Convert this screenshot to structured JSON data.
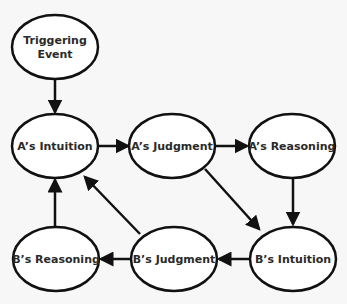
{
  "diagram": {
    "title": "",
    "nodes": [
      {
        "id": "trigger",
        "label_lines": [
          "Triggering",
          "Event"
        ],
        "cx": 55,
        "cy": 47,
        "rx": 43,
        "ry": 32
      },
      {
        "id": "a_intuition",
        "label_lines": [
          "A’s Intuition"
        ],
        "cx": 55,
        "cy": 146,
        "rx": 43,
        "ry": 32
      },
      {
        "id": "a_judgment",
        "label_lines": [
          "A’s Judgment"
        ],
        "cx": 172,
        "cy": 146,
        "rx": 43,
        "ry": 32
      },
      {
        "id": "a_reasoning",
        "label_lines": [
          "A’s Reasoning"
        ],
        "cx": 292,
        "cy": 146,
        "rx": 43,
        "ry": 32
      },
      {
        "id": "b_reasoning",
        "label_lines": [
          "B’s Reasoning"
        ],
        "cx": 56,
        "cy": 259,
        "rx": 43,
        "ry": 32
      },
      {
        "id": "b_judgment",
        "label_lines": [
          "B’s Judgment"
        ],
        "cx": 174,
        "cy": 259,
        "rx": 43,
        "ry": 32
      },
      {
        "id": "b_intuition",
        "label_lines": [
          "B’s Intuition"
        ],
        "cx": 293,
        "cy": 259,
        "rx": 43,
        "ry": 32
      }
    ],
    "edges": [
      {
        "from": "trigger",
        "to": "a_intuition",
        "x1": 55,
        "y1": 80,
        "x2": 55,
        "y2": 112
      },
      {
        "from": "a_intuition",
        "to": "a_judgment",
        "x1": 98,
        "y1": 146,
        "x2": 128,
        "y2": 146
      },
      {
        "from": "a_judgment",
        "to": "a_reasoning",
        "x1": 216,
        "y1": 146,
        "x2": 247,
        "y2": 146
      },
      {
        "from": "a_reasoning",
        "to": "b_intuition",
        "x1": 293,
        "y1": 178,
        "x2": 293,
        "y2": 224
      },
      {
        "from": "a_judgment",
        "to": "b_intuition",
        "x1": 205,
        "y1": 169,
        "x2": 259,
        "y2": 229
      },
      {
        "from": "b_intuition",
        "to": "b_judgment",
        "x1": 250,
        "y1": 259,
        "x2": 219,
        "y2": 259
      },
      {
        "from": "b_judgment",
        "to": "b_reasoning",
        "x1": 131,
        "y1": 259,
        "x2": 101,
        "y2": 259
      },
      {
        "from": "b_reasoning",
        "to": "a_intuition",
        "x1": 55,
        "y1": 227,
        "x2": 55,
        "y2": 180
      },
      {
        "from": "b_judgment",
        "to": "a_intuition",
        "x1": 140,
        "y1": 234,
        "x2": 85,
        "y2": 177
      }
    ],
    "colors": {
      "stroke": "#111111",
      "fill": "#ffffff",
      "text": "#2a2a2a",
      "background": "#f7f7f7"
    }
  }
}
